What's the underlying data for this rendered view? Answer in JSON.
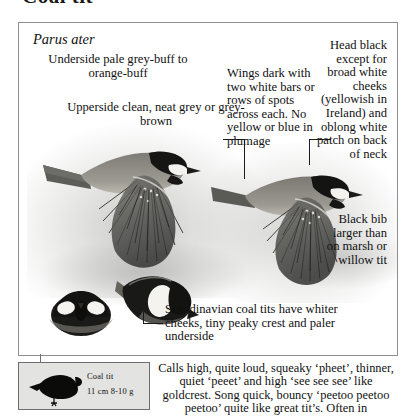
{
  "page": {
    "heading": "Coal tit",
    "scientific_name": "Parus ater"
  },
  "callouts": [
    {
      "id": "underside",
      "name": "callout-underside",
      "text": "Underside pale grey-buff to orange-buff"
    },
    {
      "id": "upperside",
      "name": "callout-upperside",
      "text": "Upperside clean, neat grey or grey-brown"
    },
    {
      "id": "wings",
      "name": "callout-wings",
      "text": "Wings dark with two white bars or rows of spots across each. No yellow or blue in plumage"
    },
    {
      "id": "head",
      "name": "callout-head",
      "text": "Head black except for broad white cheeks (yellowish in Ireland) and oblong white patch on back of neck"
    },
    {
      "id": "bib",
      "name": "callout-bib",
      "text": "Black bib larger than on marsh or willow tit"
    },
    {
      "id": "scandinavian",
      "name": "callout-scandinavian",
      "text": "Scandinavian coal tits have whiter cheeks, tiny peaky crest and paler underside"
    }
  ],
  "caption": {
    "species": "Coal tit",
    "measurements": "11 cm  8-10 g"
  },
  "calls": {
    "text": "Calls high, quite loud, squeaky ‘pheet’, thinner, quiet ‘peeet’ and high ‘see see see’ like goldcrest. Song quick, bouncy ‘peetoo peetoo peetoo’ quite like great tit’s. Often in"
  },
  "colors": {
    "frame_border": "#8e8e94",
    "caption_background": "#e3e3e1",
    "text": "#111111",
    "leader_line": "#1b1b1b"
  },
  "illustrations": [
    {
      "name": "flying-coal-tit-left",
      "description": "coal tit in flight, left"
    },
    {
      "name": "flying-coal-tit-right",
      "description": "coal tit in flight, right"
    },
    {
      "name": "perched-coal-tit-front",
      "description": "coal tit head-on detail"
    },
    {
      "name": "perched-coal-tit-side",
      "description": "coal tit side detail"
    },
    {
      "name": "caption-bird-silhouette",
      "description": "black coal tit silhouette"
    }
  ]
}
